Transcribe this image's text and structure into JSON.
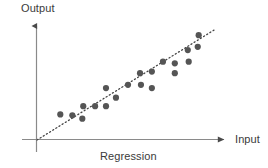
{
  "chart_data": {
    "type": "scatter",
    "title": "",
    "caption": "Regression",
    "xlabel": "Input",
    "ylabel": "Output",
    "grid": false,
    "legend": null,
    "axis_style": "arrow-axes-no-ticks",
    "xlim": [
      0,
      1
    ],
    "ylim": [
      0,
      1
    ],
    "tick_labels": {
      "x": [],
      "y": []
    },
    "points": [
      {
        "x": 0.124,
        "y": 0.217
      },
      {
        "x": 0.188,
        "y": 0.209
      },
      {
        "x": 0.241,
        "y": 0.181
      },
      {
        "x": 0.246,
        "y": 0.287
      },
      {
        "x": 0.309,
        "y": 0.287
      },
      {
        "x": 0.367,
        "y": 0.287
      },
      {
        "x": 0.367,
        "y": 0.44
      },
      {
        "x": 0.42,
        "y": 0.359
      },
      {
        "x": 0.484,
        "y": 0.468
      },
      {
        "x": 0.548,
        "y": 0.566
      },
      {
        "x": 0.553,
        "y": 0.468
      },
      {
        "x": 0.611,
        "y": 0.44
      },
      {
        "x": 0.611,
        "y": 0.58
      },
      {
        "x": 0.67,
        "y": 0.664
      },
      {
        "x": 0.733,
        "y": 0.65
      },
      {
        "x": 0.733,
        "y": 0.566
      },
      {
        "x": 0.802,
        "y": 0.762
      },
      {
        "x": 0.807,
        "y": 0.664
      },
      {
        "x": 0.855,
        "y": 0.79
      },
      {
        "x": 0.86,
        "y": 0.888
      }
    ],
    "fit_line": {
      "style": "dotted",
      "x_start": 0.0,
      "y_start": 0.0,
      "x_end": 0.95,
      "y_end": 0.94
    },
    "colors": {
      "point": "#555555",
      "axis": "#707070",
      "fit_line": "#444444",
      "text": "#3a3a3a",
      "background": "#ffffff"
    }
  }
}
